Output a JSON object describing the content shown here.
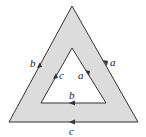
{
  "diagram": {
    "fill_color": "#dcdcdc",
    "stroke_color": "#333333",
    "outer_triangle": {
      "points": [
        [
          72,
          6
        ],
        [
          138,
          122
        ],
        [
          9,
          122
        ]
      ],
      "edges": [
        {
          "side": "left",
          "label": "b",
          "direction": "up"
        },
        {
          "side": "right",
          "label": "a",
          "direction": "down"
        },
        {
          "side": "bottom",
          "label": "c",
          "direction": "left"
        }
      ]
    },
    "inner_triangle": {
      "points": [
        [
          72,
          48
        ],
        [
          106,
          103
        ],
        [
          41,
          103
        ]
      ],
      "edges": [
        {
          "side": "left",
          "label": "c",
          "direction": "up"
        },
        {
          "side": "right",
          "label": "a",
          "direction": "down"
        },
        {
          "side": "bottom",
          "label": "b",
          "direction": "left"
        }
      ]
    }
  }
}
